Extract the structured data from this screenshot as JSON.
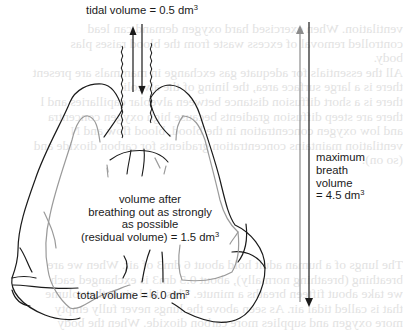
{
  "diagram": {
    "labels": {
      "tidal_volume": {
        "text": "tidal volume = 0.5 dm",
        "sup": "3"
      },
      "residual": {
        "line1": "volume after",
        "line2": "breathing out as strongly",
        "line3": "as possible",
        "line4": "(residual volume) = 1.5 dm",
        "sup": "3"
      },
      "total_volume": {
        "text": "total volume = 6.0 dm",
        "sup": "3"
      },
      "max_breath": {
        "line1": "maximum",
        "line2": "breath",
        "line3": "volume",
        "line4": "= 4.5 dm",
        "sup": "3"
      }
    },
    "values": {
      "tidal_volume_dm3": 0.5,
      "residual_volume_dm3": 1.5,
      "total_volume_dm3": 6.0,
      "maximum_breath_volume_dm3": 4.5
    },
    "colors": {
      "outer_lung_outline": "#1a1a1a",
      "inner_lung_outline": "#9a9a9a",
      "max_breath_up_arrow": "#8c8c8c",
      "arrows_dark": "#1a1a1a",
      "showthrough_text": "#d9d9d9"
    },
    "icons": {
      "tidal_in_arrow": "arrow-up-icon",
      "tidal_out_arrow": "arrow-down-icon",
      "max_inhale_arrow": "arrow-up-icon",
      "max_exhale_arrow": "arrow-down-icon"
    }
  },
  "showthrough": {
    "lines_top": [
      "ventilation. When exercised hard oxygen demand can lead",
      "controlled removal of excess waste from the blood raises plas",
      "body.",
      "All the essentials for adequate gas exchange in mammals are present",
      "there is a large surface area, the lining of the alveoli",
      "there is a short diffusion distance between alveolar capillaries and l",
      "there are steep diffusion gradients because high oxygen concentra",
      "and low oxygen concentration in the blood, blood flow and N",
      "ventilation maintains concentration gradients for carbon dioxide and",
      "(so on)."
    ],
    "lines_bottom": [
      "The lungs of a human adult hold about 6 dm3 of air. When we are",
      "breathing (breathing normally), about 0.5 dm3 is exchanged each",
      "we take about fifteen breaths a minute. This tidal air is the volume",
      "that is called tidal air. As seen above the lungs never fully empty",
      "more oxygen and supplies more carbon dioxide. When the body"
    ]
  }
}
